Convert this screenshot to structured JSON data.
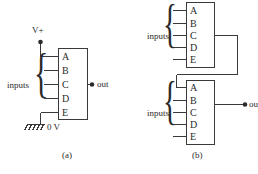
{
  "figure": {
    "background_color": "#ffffff",
    "line_color": "#3a3a3a",
    "text_color": "#2b2b2b"
  },
  "panel_a": {
    "caption": "(a)",
    "power_label": "V+",
    "ground_label": "0 V",
    "inputs_label": "inputs",
    "output_label": "out",
    "pins": [
      "A",
      "B",
      "C",
      "D",
      "E"
    ]
  },
  "panel_b": {
    "caption": "(b)",
    "output_label": "out",
    "top_block": {
      "inputs_label": "inputs",
      "pins": [
        "A",
        "B",
        "C",
        "D",
        "E"
      ]
    },
    "bottom_block": {
      "inputs_label": "inputs",
      "pins": [
        "A",
        "B",
        "C",
        "D",
        "E"
      ]
    }
  }
}
